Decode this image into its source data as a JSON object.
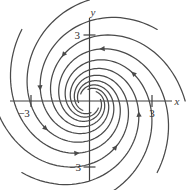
{
  "figure": {
    "kind": "phase-portrait",
    "background": "#ffffff",
    "curve_color": "#4a4a4a",
    "axis_color": "#3f3f3f"
  },
  "axes": {
    "x_axis_label": "x",
    "y_axis_label": "y",
    "x_ticks": [
      {
        "value": -3,
        "label": "−3"
      },
      {
        "value": 3,
        "label": "3"
      }
    ],
    "y_ticks": [
      {
        "value": 3,
        "label": "3"
      },
      {
        "value": -3,
        "label": "−3"
      }
    ]
  },
  "chart_data": {
    "type": "line",
    "title": "",
    "subtitle": "",
    "xlabel": "x",
    "ylabel": "y",
    "xlim": [
      -4.3,
      4.3
    ],
    "ylim": [
      -4.3,
      4.3
    ],
    "grid": false,
    "legend": null,
    "equilibrium": {
      "x": 0,
      "y": 0,
      "classification": "spiral sink"
    },
    "spiral": {
      "model": "r = r0 * exp(-k * theta)",
      "decay_k": 0.3,
      "rotation": "clockwise-inward",
      "r0": 4.6,
      "theta_span_radians": 7.2
    },
    "series": [
      {
        "name": "trajectory-1",
        "start_angle_deg": 0,
        "arrow_t": 0.3
      },
      {
        "name": "trajectory-2",
        "start_angle_deg": 45,
        "arrow_t": 0.3
      },
      {
        "name": "trajectory-3",
        "start_angle_deg": 90,
        "arrow_t": 0.3
      },
      {
        "name": "trajectory-4",
        "start_angle_deg": 135,
        "arrow_t": 0.3
      },
      {
        "name": "trajectory-5",
        "start_angle_deg": 180,
        "arrow_t": 0.3
      },
      {
        "name": "trajectory-6",
        "start_angle_deg": 225,
        "arrow_t": 0.3
      },
      {
        "name": "trajectory-7",
        "start_angle_deg": 270,
        "arrow_t": 0.3
      },
      {
        "name": "trajectory-8",
        "start_angle_deg": 315,
        "arrow_t": 0.3
      }
    ]
  }
}
